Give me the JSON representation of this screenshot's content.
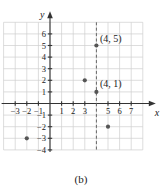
{
  "figure": {
    "caption": "(b)",
    "axis_labels": {
      "x": "x",
      "y": "y"
    }
  },
  "chart_data": {
    "type": "scatter",
    "title": "",
    "xlabel": "x",
    "ylabel": "y",
    "grid": true,
    "legend": "none",
    "xlim": [
      -4,
      8
    ],
    "ylim": [
      -4,
      7
    ],
    "x_ticks": [
      -3,
      -2,
      -1,
      1,
      2,
      3,
      5,
      6,
      7
    ],
    "x_tick_labels": [
      "−3",
      "−2",
      "−1",
      "1",
      "2",
      "3",
      "5",
      "6",
      "7"
    ],
    "y_ticks": [
      6,
      5,
      4,
      3,
      2,
      1,
      -1,
      -2,
      -3,
      -4
    ],
    "y_tick_labels": [
      "6",
      "5",
      "4",
      "3",
      "2",
      "1",
      "−1",
      "−2",
      "−3",
      "−4"
    ],
    "points": [
      {
        "x": 4,
        "y": 5,
        "label": "(4, 5)"
      },
      {
        "x": 3,
        "y": 2,
        "label": ""
      },
      {
        "x": 4,
        "y": 1,
        "label": "(4, 1)"
      },
      {
        "x": 5,
        "y": -2,
        "label": ""
      },
      {
        "x": -2,
        "y": -3,
        "label": ""
      }
    ],
    "annotations": [
      {
        "text": "(4, 5)",
        "x": 4.3,
        "y": 5.6
      },
      {
        "text": "(4, 1)",
        "x": 4.3,
        "y": 1.7
      }
    ],
    "guide_lines": [
      {
        "orientation": "vertical",
        "value": 4,
        "style": "dashed"
      }
    ],
    "colors": {
      "grid": "#cfcfcf",
      "axis": "#333333",
      "point": "#555555",
      "guide": "#666666",
      "text": "#1a1a1a"
    }
  }
}
